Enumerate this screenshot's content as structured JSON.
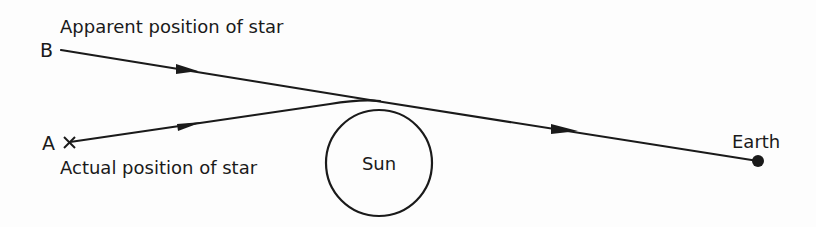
{
  "diagram": {
    "labels": {
      "point_b": "B",
      "point_a": "A",
      "apparent_position": "Apparent position of star",
      "actual_position": "Actual position of star",
      "sun": "Sun",
      "earth": "Earth"
    },
    "nodes": [
      {
        "id": "B",
        "label": "B",
        "role": "apparent star position",
        "marker": "line-end"
      },
      {
        "id": "A",
        "label": "A",
        "role": "actual star position",
        "marker": "cross"
      },
      {
        "id": "sun",
        "label": "Sun",
        "shape": "circle"
      },
      {
        "id": "earth",
        "label": "Earth",
        "marker": "filled-dot"
      }
    ],
    "edges": [
      {
        "from": "A",
        "to": "sun-limb",
        "style": "solid with arrow",
        "note": "actual light path bent near Sun"
      },
      {
        "from": "B",
        "to": "earth",
        "style": "solid with arrows",
        "note": "apparent straight-line direction seen from Earth"
      }
    ],
    "colors": {
      "ink": "#1a1a1a",
      "paper": "#fdfdfd"
    }
  }
}
